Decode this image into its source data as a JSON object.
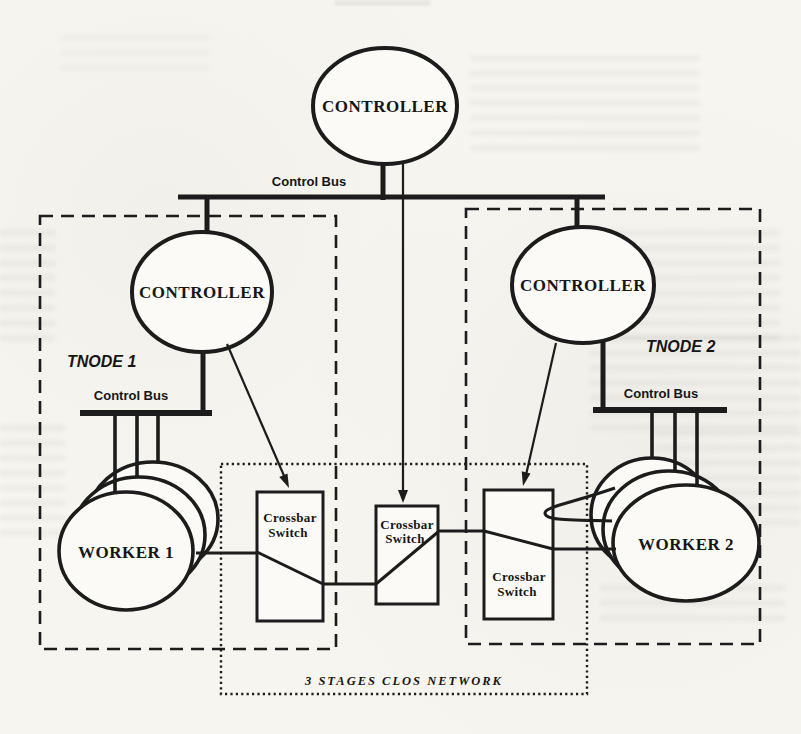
{
  "colors": {
    "ink": "#1c1c1c",
    "paper": "#f7f5f0"
  },
  "top_controller": {
    "label": "CONTROLLER"
  },
  "top_bus": {
    "label": "Control Bus"
  },
  "tnode1": {
    "title": "TNODE 1",
    "controller_label": "CONTROLLER",
    "bus_label": "Control Bus",
    "worker_label": "WORKER 1"
  },
  "tnode2": {
    "title": "TNODE 2",
    "controller_label": "CONTROLLER",
    "bus_label": "Control Bus",
    "worker_label": "WORKER 2"
  },
  "clos": {
    "title": "3 STAGES CLOS NETWORK",
    "switches": [
      {
        "line1": "Crossbar",
        "line2": "Switch"
      },
      {
        "line1": "Crossbar",
        "line2": "Switch"
      },
      {
        "line1": "Crossbar",
        "line2": "Switch"
      }
    ]
  }
}
